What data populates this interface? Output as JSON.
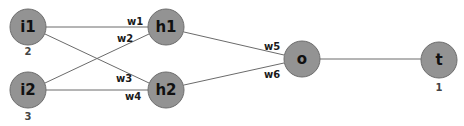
{
  "diagram": {
    "type": "neural-network",
    "colors": {
      "node_fill": "#939393",
      "node_stroke": "#6e6e6e",
      "edge": "#6b6b6b",
      "text": "#111111"
    },
    "nodes": [
      {
        "id": "i1",
        "label": "i1",
        "value": "2",
        "layer": "input"
      },
      {
        "id": "i2",
        "label": "i2",
        "value": "3",
        "layer": "input"
      },
      {
        "id": "h1",
        "label": "h1",
        "layer": "hidden"
      },
      {
        "id": "h2",
        "label": "h2",
        "layer": "hidden"
      },
      {
        "id": "o",
        "label": "o",
        "layer": "output"
      },
      {
        "id": "t",
        "label": "t",
        "value": "1",
        "layer": "target"
      }
    ],
    "edges": [
      {
        "from": "i1",
        "to": "h1",
        "weight": "w1"
      },
      {
        "from": "i2",
        "to": "h1",
        "weight": "w2"
      },
      {
        "from": "i1",
        "to": "h2",
        "weight": "w3"
      },
      {
        "from": "i2",
        "to": "h2",
        "weight": "w4"
      },
      {
        "from": "h1",
        "to": "o",
        "weight": "w5"
      },
      {
        "from": "h2",
        "to": "o",
        "weight": "w6"
      },
      {
        "from": "o",
        "to": "t"
      }
    ]
  }
}
